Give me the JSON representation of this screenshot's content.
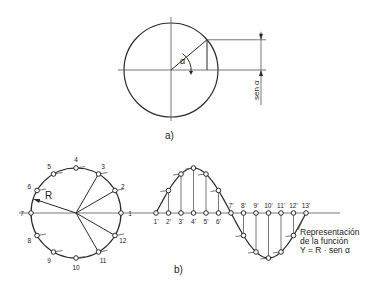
{
  "figure_a": {
    "caption": "a)",
    "angle_label": "α",
    "dimension_label": "sen α",
    "circle": {
      "cx": 171,
      "cy": 70,
      "r": 47
    },
    "angle_deg": 40
  },
  "figure_b": {
    "caption": "b)",
    "radius_label": "R",
    "circle": {
      "cx": 76,
      "cy": 213,
      "r": 45
    },
    "circle_points": [
      "1",
      "2",
      "3",
      "4",
      "5",
      "6",
      "7",
      "8",
      "9",
      "10",
      "11",
      "12"
    ],
    "projection_points": [
      "1'",
      "2'",
      "3'",
      "4'",
      "5'",
      "6'",
      "7'",
      "8'",
      "9'",
      "10'",
      "11'",
      "12'",
      "13'"
    ],
    "wave": {
      "x_start": 156,
      "step": 12.5,
      "axis_y": 213,
      "amplitude": 45,
      "axis_end": 340
    },
    "annotation": {
      "line1": "Representación",
      "line2": "de la función",
      "line3": "Y = R · sen α"
    }
  },
  "colors": {
    "stroke": "#2a2a2a",
    "background": "#ffffff"
  }
}
